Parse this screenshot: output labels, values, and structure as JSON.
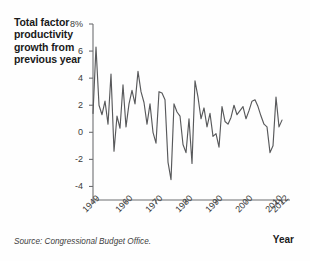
{
  "chart_title": "Total factor\nproductivity\ngrowth from\nprevious year",
  "source_note": "Source: Congressional Budget Office.",
  "year_axis_title": "Year",
  "colors": {
    "line": "#58595b",
    "axis": "#6d6e71",
    "text": "#231f20",
    "background": "#fefefe"
  },
  "chart_data": {
    "type": "line",
    "title": "Total factor productivity growth from previous year",
    "subtitle": "",
    "xlabel": "Year",
    "ylabel": "Total factor productivity growth from previous year",
    "grid": false,
    "legend": "none",
    "xlim": [
      1949,
      2012
    ],
    "ylim": [
      -5,
      8
    ],
    "ytick_labels": [
      "8%",
      "6",
      "4",
      "2",
      "0",
      "-2",
      "-4"
    ],
    "ytick_values": [
      8,
      6,
      4,
      2,
      0,
      -2,
      -4
    ],
    "xtick_labels": [
      "1949",
      "1960",
      "1970",
      "1980",
      "1990",
      "2000",
      "2010",
      "2012"
    ],
    "xtick_values": [
      1949,
      1960,
      1970,
      1980,
      1990,
      2000,
      2010,
      2012
    ],
    "x": [
      1949,
      1950,
      1951,
      1952,
      1953,
      1954,
      1955,
      1956,
      1957,
      1958,
      1959,
      1960,
      1961,
      1962,
      1963,
      1964,
      1965,
      1966,
      1967,
      1968,
      1969,
      1970,
      1971,
      1972,
      1973,
      1974,
      1975,
      1976,
      1977,
      1978,
      1979,
      1980,
      1981,
      1982,
      1983,
      1984,
      1985,
      1986,
      1987,
      1988,
      1989,
      1990,
      1991,
      1992,
      1993,
      1994,
      1995,
      1996,
      1997,
      1998,
      1999,
      2000,
      2001,
      2002,
      2003,
      2004,
      2005,
      2006,
      2007,
      2008,
      2009,
      2010,
      2011,
      2012
    ],
    "series": [
      {
        "name": "Total factor productivity growth",
        "values": [
          1.4,
          6.3,
          2.0,
          1.3,
          2.3,
          0.6,
          4.3,
          -1.4,
          1.2,
          0.3,
          3.5,
          0.4,
          2.1,
          3.1,
          2.1,
          4.5,
          3.0,
          2.2,
          0.6,
          2.1,
          0.0,
          -0.8,
          3.0,
          2.9,
          2.4,
          -2.2,
          -3.5,
          2.1,
          1.5,
          1.2,
          -0.9,
          -1.5,
          1.0,
          -2.3,
          3.8,
          2.6,
          1.0,
          1.8,
          0.4,
          1.4,
          -0.3,
          -0.1,
          -1.1,
          1.9,
          0.8,
          0.6,
          1.1,
          2.0,
          1.3,
          1.6,
          1.9,
          1.0,
          1.6,
          2.3,
          2.4,
          1.9,
          1.2,
          0.6,
          0.4,
          -1.5,
          -1.0,
          2.6,
          0.4,
          0.9
        ]
      }
    ]
  }
}
